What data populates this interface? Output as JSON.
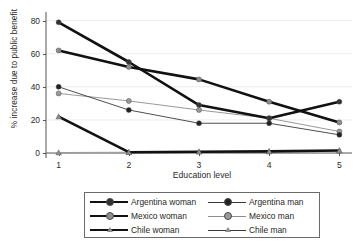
{
  "chart_data": {
    "type": "line",
    "title": "",
    "xlabel": "Education level",
    "ylabel": "% increase due to public benefit",
    "x": [
      1,
      2,
      3,
      4,
      5
    ],
    "xticklabels": [
      "1",
      "2",
      "3",
      "4",
      "5"
    ],
    "yticklabels": [
      "0",
      "20",
      "40",
      "60",
      "80"
    ],
    "yticks": [
      0,
      20,
      40,
      60,
      80
    ],
    "xlim": [
      0.82,
      5.18
    ],
    "ylim": [
      -3,
      84
    ],
    "grid": "horizontal-faint",
    "legend_position": "below-plot",
    "series": [
      {
        "name": "Argentina woman",
        "values": [
          79,
          55,
          29,
          21,
          31
        ],
        "color": "#111111",
        "marker": "circle",
        "marker_color": "#333333",
        "width": "thick"
      },
      {
        "name": "Mexico woman",
        "values": [
          62,
          52,
          44.5,
          31,
          18.5
        ],
        "color": "#111111",
        "marker": "circle",
        "marker_color": "#8d8d8d",
        "width": "thick"
      },
      {
        "name": "Chile woman",
        "values": [
          22,
          0.5,
          0.8,
          1,
          1.5
        ],
        "color": "#111111",
        "marker": "triangle",
        "marker_color": "#8d8d8d",
        "width": "thick"
      },
      {
        "name": "Argentina man",
        "values": [
          40,
          26,
          18,
          18,
          11
        ],
        "color": "#3a3a3a",
        "marker": "circle",
        "marker_color": "#222222",
        "width": "thin"
      },
      {
        "name": "Mexico man",
        "values": [
          36,
          31.5,
          26,
          21,
          13
        ],
        "color": "#8d8d8d",
        "marker": "circle",
        "marker_color": "#9a9a9a",
        "width": "thin"
      },
      {
        "name": "Chile man",
        "values": [
          0.3,
          0.5,
          0.8,
          1,
          1.5
        ],
        "color": "#9a9a9a",
        "marker": "triangle",
        "marker_color": "#8d8d8d",
        "width": "thin"
      }
    ]
  },
  "legend": {
    "entries": [
      {
        "label": "Argentina woman",
        "marker": "circle",
        "width": "thick",
        "marker_color": "#333333"
      },
      {
        "label": "Argentina man",
        "marker": "circle",
        "width": "thin",
        "marker_color": "#222222"
      },
      {
        "label": "Mexico woman",
        "marker": "circle",
        "width": "thick",
        "marker_color": "#8d8d8d"
      },
      {
        "label": "Mexico man",
        "marker": "circle",
        "width": "thin",
        "marker_color": "#9a9a9a"
      },
      {
        "label": "Chile woman",
        "marker": "triangle",
        "width": "thick",
        "marker_color": "#8d8d8d"
      },
      {
        "label": "Chile man",
        "marker": "triangle",
        "width": "thin",
        "marker_color": "#8d8d8d"
      }
    ]
  }
}
